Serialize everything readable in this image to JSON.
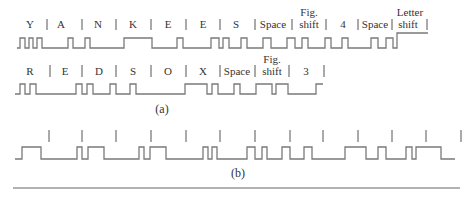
{
  "figure": {
    "part_a": {
      "caption": "(a)",
      "row1": {
        "labels": [
          {
            "text": "Y",
            "x": 30
          },
          {
            "text": "A",
            "x": 61
          },
          {
            "text": "N",
            "x": 98
          },
          {
            "text": "K",
            "x": 133
          },
          {
            "text": "E",
            "x": 168
          },
          {
            "text": "E",
            "x": 203
          },
          {
            "text": "S",
            "x": 236
          },
          {
            "text": "Space",
            "x": 273
          },
          {
            "text": "Fig.",
            "x": 309,
            "dy": -12
          },
          {
            "text": "shift",
            "x": 309
          },
          {
            "text": "4",
            "x": 343
          },
          {
            "text": "Space",
            "x": 375
          },
          {
            "text": "Letter",
            "x": 410,
            "dy": -12
          },
          {
            "text": "shift",
            "x": 408
          }
        ],
        "dividers": [
          47,
          82,
          116,
          151,
          186,
          220,
          255,
          292,
          326,
          358,
          392,
          427
        ],
        "waveform": [
          [
            17,
            48
          ],
          [
            20,
            48
          ],
          [
            20,
            38
          ],
          [
            25,
            38
          ],
          [
            25,
            48
          ],
          [
            29,
            48
          ],
          [
            29,
            38
          ],
          [
            33,
            38
          ],
          [
            33,
            48
          ],
          [
            37,
            48
          ],
          [
            37,
            38
          ],
          [
            42,
            38
          ],
          [
            42,
            48
          ],
          [
            48,
            48
          ],
          [
            48,
            48
          ],
          [
            68,
            48
          ],
          [
            68,
            38
          ],
          [
            73,
            38
          ],
          [
            73,
            48
          ],
          [
            85,
            48
          ],
          [
            85,
            38
          ],
          [
            90,
            38
          ],
          [
            90,
            48
          ],
          [
            103,
            48
          ],
          [
            103,
            48
          ],
          [
            124,
            48
          ],
          [
            124,
            38
          ],
          [
            152,
            38
          ],
          [
            152,
            48
          ],
          [
            177,
            48
          ],
          [
            177,
            38
          ],
          [
            183,
            38
          ],
          [
            183,
            48
          ],
          [
            211,
            48
          ],
          [
            211,
            38
          ],
          [
            219,
            38
          ],
          [
            219,
            48
          ],
          [
            223,
            48
          ],
          [
            223,
            38
          ],
          [
            229,
            38
          ],
          [
            229,
            48
          ],
          [
            241,
            48
          ],
          [
            241,
            38
          ],
          [
            247,
            38
          ],
          [
            247,
            48
          ],
          [
            263,
            48
          ],
          [
            263,
            38
          ],
          [
            271,
            38
          ],
          [
            271,
            48
          ],
          [
            287,
            48
          ],
          [
            287,
            38
          ],
          [
            295,
            38
          ],
          [
            295,
            48
          ],
          [
            302,
            48
          ],
          [
            302,
            38
          ],
          [
            308,
            38
          ],
          [
            308,
            48
          ],
          [
            325,
            48
          ],
          [
            325,
            38
          ],
          [
            331,
            38
          ],
          [
            331,
            48
          ],
          [
            342,
            48
          ],
          [
            342,
            38
          ],
          [
            348,
            38
          ],
          [
            348,
            48
          ],
          [
            371,
            48
          ],
          [
            371,
            38
          ],
          [
            378,
            38
          ],
          [
            378,
            48
          ],
          [
            386,
            48
          ],
          [
            386,
            38
          ],
          [
            393,
            38
          ],
          [
            393,
            48
          ],
          [
            397,
            48
          ],
          [
            397,
            33
          ],
          [
            428,
            33
          ]
        ]
      },
      "row2": {
        "labels": [
          {
            "text": "R",
            "x": 30
          },
          {
            "text": "E",
            "x": 65
          },
          {
            "text": "D",
            "x": 99
          },
          {
            "text": "S",
            "x": 133
          },
          {
            "text": "O",
            "x": 168
          },
          {
            "text": "X",
            "x": 203
          },
          {
            "text": "Space",
            "x": 237
          },
          {
            "text": "Fig.",
            "x": 272,
            "dy": -12
          },
          {
            "text": "shift",
            "x": 272
          },
          {
            "text": "3",
            "x": 306
          }
        ],
        "dividers": [
          50,
          82,
          116,
          151,
          186,
          220,
          255,
          289,
          324
        ],
        "waveform": [
          [
            15,
            94
          ],
          [
            20,
            94
          ],
          [
            20,
            84
          ],
          [
            25,
            84
          ],
          [
            25,
            94
          ],
          [
            30,
            94
          ],
          [
            30,
            84
          ],
          [
            36,
            84
          ],
          [
            36,
            94
          ],
          [
            76,
            94
          ],
          [
            76,
            84
          ],
          [
            82,
            84
          ],
          [
            82,
            94
          ],
          [
            87,
            94
          ],
          [
            87,
            84
          ],
          [
            93,
            84
          ],
          [
            93,
            94
          ],
          [
            110,
            94
          ],
          [
            110,
            84
          ],
          [
            116,
            84
          ],
          [
            116,
            94
          ],
          [
            130,
            94
          ],
          [
            130,
            84
          ],
          [
            136,
            84
          ],
          [
            136,
            94
          ],
          [
            146,
            94
          ],
          [
            146,
            94
          ],
          [
            185,
            94
          ],
          [
            185,
            84
          ],
          [
            207,
            84
          ],
          [
            207,
            94
          ],
          [
            212,
            94
          ],
          [
            212,
            84
          ],
          [
            218,
            84
          ],
          [
            218,
            94
          ],
          [
            234,
            94
          ],
          [
            234,
            84
          ],
          [
            240,
            84
          ],
          [
            240,
            94
          ],
          [
            256,
            94
          ],
          [
            256,
            84
          ],
          [
            272,
            84
          ],
          [
            272,
            94
          ],
          [
            276,
            94
          ],
          [
            276,
            84
          ],
          [
            288,
            84
          ],
          [
            288,
            94
          ],
          [
            316,
            94
          ],
          [
            316,
            84
          ],
          [
            323,
            84
          ]
        ]
      }
    },
    "part_b": {
      "caption": "(b)",
      "ticks": [
        49,
        82,
        116,
        151,
        186,
        220,
        255,
        290,
        323,
        358,
        392,
        426,
        461
      ],
      "waveform": [
        [
          15,
          159
        ],
        [
          22,
          159
        ],
        [
          22,
          147
        ],
        [
          41,
          147
        ],
        [
          41,
          159
        ],
        [
          77,
          159
        ],
        [
          77,
          147
        ],
        [
          82,
          147
        ],
        [
          82,
          159
        ],
        [
          88,
          159
        ],
        [
          88,
          147
        ],
        [
          104,
          147
        ],
        [
          104,
          159
        ],
        [
          139,
          159
        ],
        [
          139,
          147
        ],
        [
          144,
          147
        ],
        [
          144,
          159
        ],
        [
          150,
          159
        ],
        [
          150,
          147
        ],
        [
          166,
          147
        ],
        [
          166,
          159
        ],
        [
          203,
          159
        ],
        [
          203,
          147
        ],
        [
          208,
          147
        ],
        [
          208,
          159
        ],
        [
          212,
          159
        ],
        [
          212,
          147
        ],
        [
          217,
          147
        ],
        [
          217,
          159
        ],
        [
          247,
          159
        ],
        [
          247,
          147
        ],
        [
          255,
          147
        ],
        [
          255,
          159
        ],
        [
          262,
          159
        ],
        [
          262,
          147
        ],
        [
          267,
          147
        ],
        [
          267,
          159
        ],
        [
          282,
          159
        ],
        [
          282,
          147
        ],
        [
          290,
          147
        ],
        [
          290,
          159
        ],
        [
          304,
          159
        ],
        [
          304,
          147
        ],
        [
          312,
          147
        ],
        [
          312,
          159
        ],
        [
          345,
          159
        ],
        [
          345,
          147
        ],
        [
          366,
          147
        ],
        [
          366,
          159
        ],
        [
          378,
          159
        ],
        [
          378,
          147
        ],
        [
          386,
          147
        ],
        [
          386,
          159
        ],
        [
          406,
          159
        ],
        [
          406,
          147
        ],
        [
          412,
          147
        ],
        [
          412,
          159
        ],
        [
          416,
          159
        ],
        [
          416,
          147
        ],
        [
          441,
          147
        ],
        [
          441,
          159
        ],
        [
          455,
          159
        ]
      ]
    },
    "rule_y": 188
  }
}
